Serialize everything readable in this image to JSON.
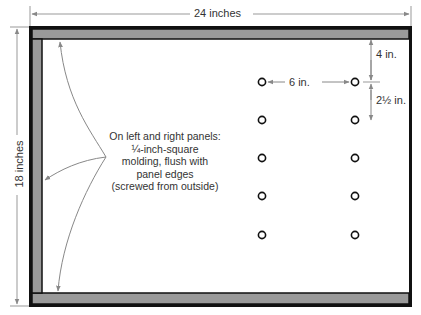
{
  "dimensions": {
    "width_label": "24 inches",
    "height_label": "18 inches",
    "top_offset_label": "4 in.",
    "hole_spacing_horizontal_label": "6 in.",
    "hole_spacing_vertical_label": "2½ in."
  },
  "annotation": {
    "lines": [
      "On left and right panels:",
      "¼-inch-square",
      "molding, flush with",
      "panel edges",
      "(screwed from outside)"
    ]
  },
  "holes": {
    "columns": 2,
    "rows": 5,
    "count": 10,
    "icon": "circle-outline-icon"
  },
  "colors": {
    "frame_outline": "#111111",
    "molding_fill": "#9a9a9a",
    "dimension_line": "#888888",
    "text": "#333333",
    "background": "#ffffff"
  }
}
